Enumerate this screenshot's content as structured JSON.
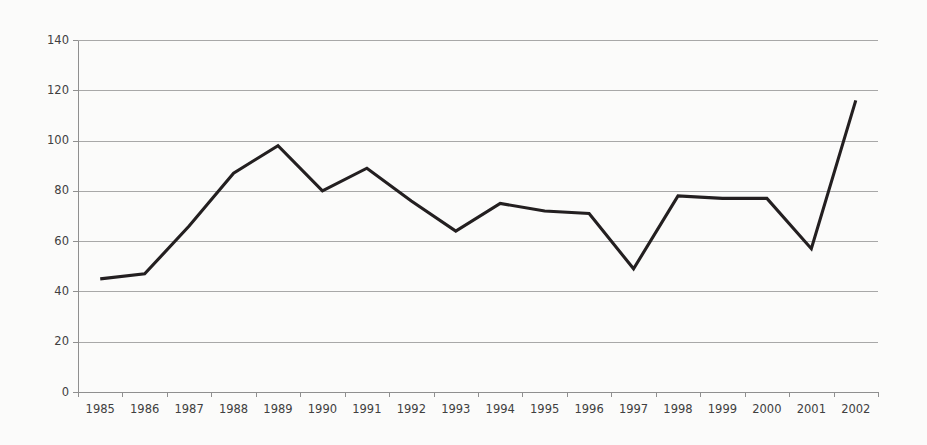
{
  "chart_data": {
    "type": "line",
    "title": "",
    "subtitle": "",
    "xlabel": "",
    "ylabel": "",
    "categories": [
      "1985",
      "1986",
      "1987",
      "1988",
      "1989",
      "1990",
      "1991",
      "1992",
      "1993",
      "1994",
      "1995",
      "1996",
      "1997",
      "1998",
      "1999",
      "2000",
      "2001",
      "2002"
    ],
    "values": [
      45,
      47,
      66,
      87,
      98,
      80,
      89,
      76,
      64,
      75,
      72,
      71,
      49,
      78,
      77,
      77,
      57,
      116
    ],
    "series": [
      {
        "name": "series-1",
        "values": [
          45,
          47,
          66,
          87,
          98,
          80,
          89,
          76,
          64,
          75,
          72,
          71,
          49,
          78,
          77,
          77,
          57,
          116
        ]
      }
    ],
    "ylim": [
      0,
      140
    ],
    "ytick_values": [
      0,
      20,
      40,
      60,
      80,
      100,
      120,
      140
    ],
    "ytick_labels": [
      "0",
      "20",
      "40",
      "60",
      "80",
      "100",
      "120",
      "140"
    ],
    "xtick_labels": [
      "1985",
      "1986",
      "1987",
      "1988",
      "1989",
      "1990",
      "1991",
      "1992",
      "1993",
      "1994",
      "1995",
      "1996",
      "1997",
      "1998",
      "1999",
      "2000",
      "2001",
      "2002"
    ],
    "grid": "horizontal",
    "legend": "none",
    "annotations": [],
    "colors": {
      "line": "#231f20",
      "grid": "#a8a8a8",
      "axis": "#8f8f8f",
      "tick_text": "#404040",
      "background": "#fbfbfa"
    }
  },
  "plot_geometry": {
    "left": 78,
    "right": 878,
    "top": 40,
    "bottom": 392
  }
}
